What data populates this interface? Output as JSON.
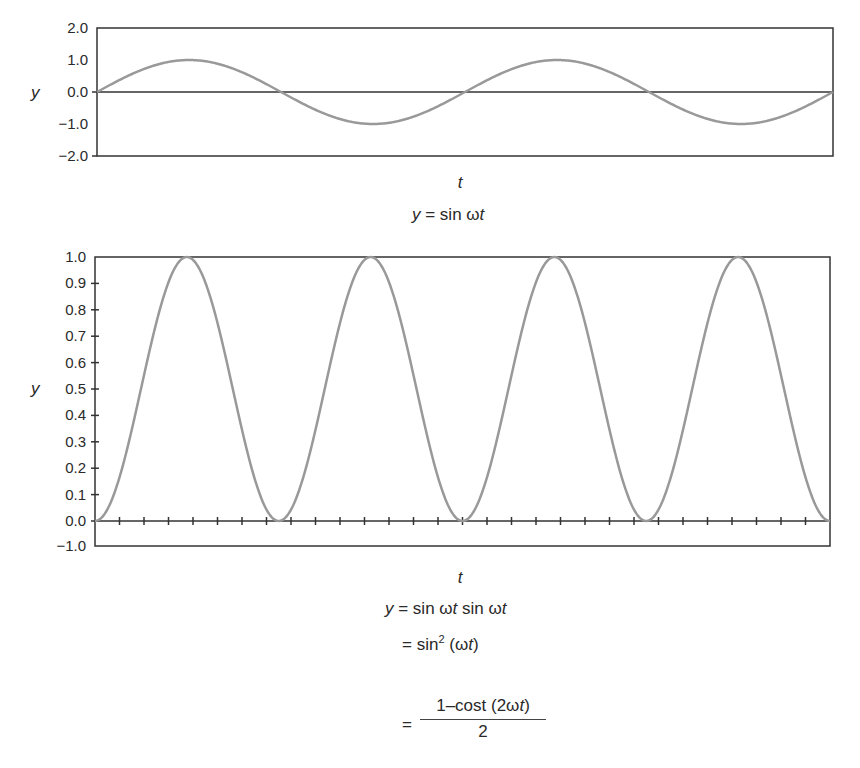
{
  "chart_data": [
    {
      "type": "line",
      "title": "y = sin ωt",
      "xlabel": "t",
      "ylabel": "y",
      "ylim": [
        -2.0,
        2.0
      ],
      "yticks": [
        "2.0",
        "1.0",
        "0.0",
        "−1.0",
        "−2.0"
      ],
      "grid": false,
      "legend": null,
      "series": [
        {
          "name": "sin ωt",
          "periods": 2,
          "amplitude": 1.0,
          "x": [
            0,
            0.125,
            0.25,
            0.375,
            0.5,
            0.625,
            0.75,
            0.875,
            1.0
          ],
          "values": [
            0,
            1.0,
            0,
            -1.0,
            0,
            1.0,
            0,
            -1.0,
            0
          ]
        }
      ],
      "color": "#999999"
    },
    {
      "type": "line",
      "title": "y = sin ωt sin ωt = sin² (ωt) = (1−cost (2ωt))/2",
      "xlabel": "t",
      "ylabel": "y",
      "ylim": [
        -1.0,
        1.0
      ],
      "yticks": [
        "1.0",
        "0.9",
        "0.8",
        "0.7",
        "0.6",
        "0.5",
        "0.4",
        "0.3",
        "0.2",
        "0.1",
        "0.0",
        "−1.0"
      ],
      "x_minor_ticks": 29,
      "grid": false,
      "legend": null,
      "series": [
        {
          "name": "sin² ωt",
          "periods": 4,
          "amplitude": 1.0,
          "x": [
            0,
            0.125,
            0.25,
            0.375,
            0.5,
            0.625,
            0.75,
            0.875,
            1.0
          ],
          "values": [
            0,
            1.0,
            0,
            1.0,
            0,
            1.0,
            0,
            1.0,
            0
          ]
        }
      ],
      "color": "#999999"
    }
  ],
  "top": {
    "ylabel": "y",
    "xlabel": "t",
    "yticks": [
      "2.0",
      "1.0",
      "0.0",
      "−1.0",
      "−2.0"
    ],
    "equation": {
      "lhs": "y",
      "eq": " = sin ω",
      "var": "t"
    }
  },
  "bottom": {
    "ylabel": "y",
    "xlabel": "t",
    "yticks": [
      "1.0",
      "0.9",
      "0.8",
      "0.7",
      "0.6",
      "0.5",
      "0.4",
      "0.3",
      "0.2",
      "0.1",
      "0.0",
      "−1.0"
    ],
    "eq1": {
      "lhs": "y",
      "a": " = sin ω",
      "t1": "t",
      "b": " sin ω",
      "t2": "t"
    },
    "eq2": {
      "a": "= sin",
      "sup": "2",
      "b": " (ω",
      "t": "t",
      "c": ")"
    },
    "eq3": {
      "eq": "=",
      "num_a": "1–cost (2ω",
      "num_t": "t",
      "num_b": ")",
      "den": "2"
    }
  },
  "colors": {
    "curve": "#999999",
    "axis": "#333333",
    "text": "#2a2a2a"
  }
}
